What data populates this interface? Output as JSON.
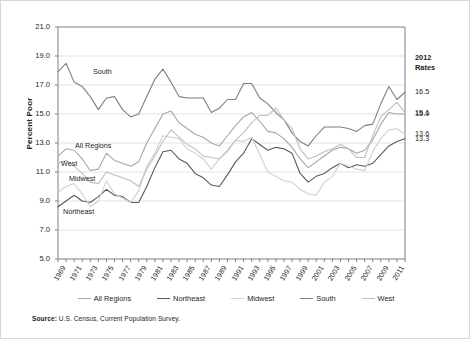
{
  "figure": {
    "ylabel": "Percent Poor",
    "source_prefix": "Source:",
    "source_text": "U.S. Census, Current Population Survey."
  },
  "rates_panel": {
    "heading_line1": "2012",
    "heading_line2": "Rates",
    "entries": [
      {
        "series": "South",
        "value": "16.5",
        "y": 16.5
      },
      {
        "series": "West",
        "value": "15.1",
        "y": 15.1
      },
      {
        "series": "All Regions",
        "value": "15.0",
        "y": 15.0
      },
      {
        "series": "Midwest",
        "value": "13.6",
        "y": 13.6
      },
      {
        "series": "Northeast",
        "value": "13.3",
        "y": 13.3
      }
    ]
  },
  "legend": {
    "position": "bottom",
    "items": [
      {
        "label": "All Regions",
        "color": "#a6a6a6"
      },
      {
        "label": "Northeast",
        "color": "#595959"
      },
      {
        "label": "Midwest",
        "color": "#d0d0d0"
      },
      {
        "label": "South",
        "color": "#7f7f7f"
      },
      {
        "label": "West",
        "color": "#bfbfbf"
      }
    ]
  },
  "inline_labels": [
    {
      "text": "South",
      "x": 92,
      "y": 66
    },
    {
      "text": "All Regions",
      "x": 74,
      "y": 140
    },
    {
      "text": "West",
      "x": 60,
      "y": 158
    },
    {
      "text": "Midwest",
      "x": 68,
      "y": 173
    },
    {
      "text": "Northeast",
      "x": 62,
      "y": 206
    }
  ],
  "chart_data": {
    "type": "line",
    "title": "",
    "xlabel": "",
    "ylabel": "Percent Poor",
    "ylim": [
      5.0,
      21.0
    ],
    "ytick_step": 2.0,
    "yticks": [
      5.0,
      7.0,
      9.0,
      11.0,
      13.0,
      15.0,
      17.0,
      19.0,
      21.0
    ],
    "grid": "horizontal",
    "xlim": [
      1969,
      2012
    ],
    "x": [
      1969,
      1970,
      1971,
      1972,
      1973,
      1974,
      1975,
      1976,
      1977,
      1978,
      1979,
      1980,
      1981,
      1982,
      1983,
      1984,
      1985,
      1986,
      1987,
      1988,
      1989,
      1990,
      1991,
      1992,
      1993,
      1994,
      1995,
      1996,
      1997,
      1998,
      1999,
      2000,
      2001,
      2002,
      2003,
      2004,
      2005,
      2006,
      2007,
      2008,
      2009,
      2010,
      2011,
      2012
    ],
    "xtick_labels": [
      "1969",
      "1971",
      "1973",
      "1975",
      "1977",
      "1979",
      "1981",
      "1983",
      "1985",
      "1987",
      "1989",
      "1991",
      "1993",
      "1995",
      "1997",
      "1999",
      "2001",
      "2003",
      "2005",
      "2007",
      "2009",
      "2011"
    ],
    "series": [
      {
        "name": "All Regions",
        "color": "#a6a6a6",
        "values": [
          12.1,
          12.6,
          12.5,
          11.9,
          11.1,
          11.2,
          12.3,
          11.8,
          11.6,
          11.4,
          11.7,
          13.0,
          14.0,
          15.0,
          15.2,
          14.4,
          14.0,
          13.6,
          13.4,
          13.0,
          12.8,
          13.5,
          14.2,
          14.8,
          15.1,
          14.5,
          13.8,
          13.7,
          13.3,
          12.7,
          11.9,
          11.3,
          11.7,
          12.1,
          12.5,
          12.7,
          12.6,
          12.3,
          12.5,
          13.2,
          14.3,
          15.1,
          15.0,
          15.0
        ]
      },
      {
        "name": "Northeast",
        "color": "#595959",
        "values": [
          8.6,
          9.0,
          9.4,
          9.0,
          8.9,
          9.3,
          9.8,
          9.4,
          9.3,
          8.9,
          8.9,
          10.0,
          11.3,
          12.4,
          12.5,
          11.9,
          11.6,
          10.9,
          10.6,
          10.1,
          10.0,
          10.8,
          11.7,
          12.3,
          13.3,
          12.9,
          12.5,
          12.7,
          12.6,
          12.3,
          10.9,
          10.3,
          10.7,
          10.9,
          11.3,
          11.6,
          11.3,
          11.5,
          11.4,
          11.6,
          12.2,
          12.8,
          13.1,
          13.3
        ]
      },
      {
        "name": "Midwest",
        "color": "#d0d0d0",
        "values": [
          9.6,
          10.0,
          10.2,
          9.5,
          8.6,
          9.0,
          10.4,
          9.5,
          9.2,
          8.9,
          9.7,
          11.4,
          12.3,
          13.5,
          13.4,
          13.3,
          12.6,
          12.3,
          11.9,
          11.2,
          11.9,
          12.4,
          13.2,
          13.1,
          13.4,
          12.2,
          11.0,
          10.7,
          10.4,
          10.3,
          9.8,
          9.5,
          9.4,
          10.3,
          10.7,
          11.6,
          11.4,
          11.2,
          11.1,
          12.4,
          13.3,
          13.9,
          14.0,
          13.6
        ]
      },
      {
        "name": "South",
        "color": "#7f7f7f",
        "values": [
          17.9,
          18.5,
          17.2,
          16.9,
          16.2,
          15.3,
          16.1,
          16.2,
          15.3,
          14.8,
          15.0,
          16.2,
          17.4,
          18.1,
          17.2,
          16.2,
          16.1,
          16.1,
          16.1,
          15.1,
          15.4,
          16.0,
          16.0,
          17.1,
          17.1,
          16.1,
          15.7,
          15.1,
          14.6,
          13.7,
          13.1,
          12.8,
          13.5,
          14.1,
          14.1,
          14.1,
          14.0,
          13.8,
          14.2,
          14.3,
          15.7,
          16.9,
          16.0,
          16.5
        ]
      },
      {
        "name": "West",
        "color": "#bfbfbf",
        "values": [
          11.6,
          11.8,
          11.4,
          10.9,
          10.3,
          10.2,
          11.0,
          10.8,
          10.6,
          10.4,
          10.0,
          11.2,
          12.1,
          13.1,
          13.9,
          13.4,
          12.9,
          12.6,
          12.1,
          12.0,
          11.9,
          12.5,
          13.2,
          13.7,
          14.4,
          14.9,
          14.9,
          15.4,
          14.6,
          14.0,
          12.6,
          11.9,
          12.1,
          12.4,
          12.6,
          12.9,
          12.6,
          12.0,
          12.0,
          13.5,
          14.8,
          15.3,
          15.8,
          15.1
        ]
      }
    ]
  }
}
